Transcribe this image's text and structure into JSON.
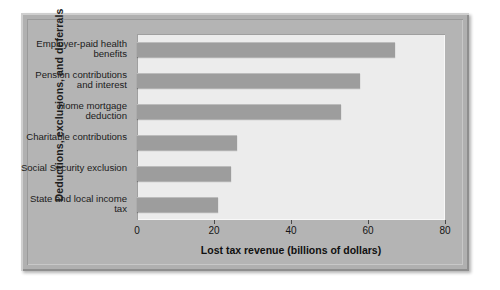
{
  "chart_data": {
    "type": "bar",
    "orientation": "horizontal",
    "title": "",
    "xlabel": "Lost tax revenue (billions of dollars)",
    "ylabel": "Deductions, exclusions, and deferrals",
    "categories": [
      "Employer-paid health benefits",
      "Pension contributions and interest",
      "Home mortgage deduction",
      "Charitable contributions",
      "Social Security exclusion",
      "State and local income tax"
    ],
    "values": [
      67,
      58,
      53,
      26,
      24.5,
      21
    ],
    "xlim": [
      0,
      80
    ],
    "xticks": [
      0,
      20,
      40,
      60,
      80
    ],
    "xtick_labels": [
      "0",
      "20",
      "40",
      "60",
      "80"
    ],
    "grid": false,
    "legend": "none",
    "bar_color": "#9d9d9d",
    "plot_background": "#ececec",
    "frame_color": "#b0b0b0"
  }
}
